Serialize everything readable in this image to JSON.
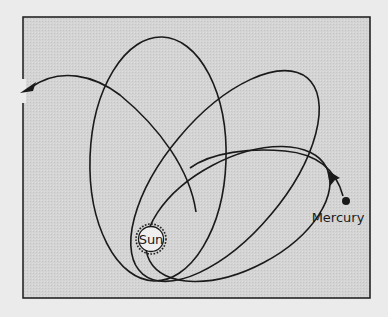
{
  "diagram": {
    "title": "",
    "labels": {
      "sun": "Sun",
      "planet": "Mercury"
    },
    "icons": {
      "sun": "circle-with-dashed-corona",
      "planet": "filled-dot",
      "direction": "arrowhead"
    },
    "colors": {
      "page_background": "#ebebeb",
      "panel_background": "#d6d6d6",
      "stroke": "#1a1a1a",
      "sun_fill": "#efefef"
    },
    "elements": {
      "orbits": [
        {
          "id": "orbit-1",
          "description": "tall near-vertical ellipse"
        },
        {
          "id": "orbit-2",
          "description": "ellipse tilted ~45 degrees"
        },
        {
          "id": "orbit-3",
          "description": "flatter ellipse tilted toward the right"
        }
      ],
      "precession_arrow": "curved arrow from Mercury sweeping over orbits to the left edge"
    }
  }
}
